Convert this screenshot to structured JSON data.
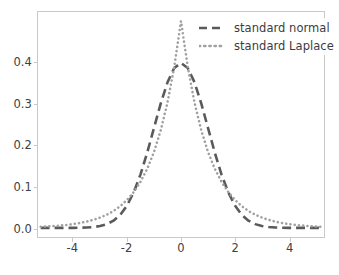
{
  "chart_data": {
    "type": "line",
    "title": "",
    "xlabel": "",
    "ylabel": "",
    "xlim": [
      -5.3,
      5.3
    ],
    "ylim": [
      -0.022,
      0.522
    ],
    "grid": false,
    "legend_position": "upper right",
    "xticks": [
      "-4",
      "-2",
      "0",
      "2",
      "4"
    ],
    "xtick_values": [
      -4,
      -2,
      0,
      2,
      4
    ],
    "yticks": [
      "0.0",
      "0.1",
      "0.2",
      "0.3",
      "0.4"
    ],
    "ytick_values": [
      0.0,
      0.1,
      0.2,
      0.3,
      0.4
    ],
    "series": [
      {
        "name": "standard normal",
        "linestyle": "dashed",
        "color": "#5a5a5a",
        "linewidth": 2.6,
        "peak_value": 0.399,
        "x": [
          -5.2,
          -5.0,
          -4.75,
          -4.5,
          -4.25,
          -4.0,
          -3.75,
          -3.5,
          -3.25,
          -3.0,
          -2.75,
          -2.5,
          -2.25,
          -2.0,
          -1.75,
          -1.5,
          -1.25,
          -1.0,
          -0.75,
          -0.5,
          -0.25,
          0.0,
          0.25,
          0.5,
          0.75,
          1.0,
          1.25,
          1.5,
          1.75,
          2.0,
          2.25,
          2.5,
          2.75,
          3.0,
          3.25,
          3.5,
          3.75,
          4.0,
          4.25,
          4.5,
          4.75,
          5.0,
          5.2
        ],
        "y": [
          0.0,
          0.0,
          0.0,
          0.0,
          0.0001,
          0.0001,
          0.0004,
          0.0009,
          0.002,
          0.0044,
          0.0091,
          0.0175,
          0.0317,
          0.054,
          0.0863,
          0.1295,
          0.1826,
          0.242,
          0.3011,
          0.3521,
          0.3867,
          0.3989,
          0.3867,
          0.3521,
          0.3011,
          0.242,
          0.1826,
          0.1295,
          0.0863,
          0.054,
          0.0317,
          0.0175,
          0.0091,
          0.0044,
          0.002,
          0.0009,
          0.0004,
          0.0001,
          0.0001,
          0.0,
          0.0,
          0.0,
          0.0
        ]
      },
      {
        "name": "standard Laplace",
        "linestyle": "dotted",
        "color": "#a0a0a0",
        "linewidth": 2.6,
        "peak_value": 0.5,
        "x": [
          -5.2,
          -5.0,
          -4.75,
          -4.5,
          -4.25,
          -4.0,
          -3.75,
          -3.5,
          -3.25,
          -3.0,
          -2.75,
          -2.5,
          -2.25,
          -2.0,
          -1.75,
          -1.5,
          -1.25,
          -1.0,
          -0.75,
          -0.5,
          -0.25,
          0.0,
          0.25,
          0.5,
          0.75,
          1.0,
          1.25,
          1.5,
          1.75,
          2.0,
          2.25,
          2.5,
          2.75,
          3.0,
          3.25,
          3.5,
          3.75,
          4.0,
          4.25,
          4.5,
          4.75,
          5.0,
          5.2
        ],
        "y": [
          0.0028,
          0.0034,
          0.0043,
          0.0056,
          0.0071,
          0.0092,
          0.0118,
          0.0151,
          0.0194,
          0.0249,
          0.032,
          0.041,
          0.0527,
          0.0677,
          0.0869,
          0.1116,
          0.1433,
          0.1839,
          0.2362,
          0.3033,
          0.3894,
          0.5,
          0.3894,
          0.3033,
          0.2362,
          0.1839,
          0.1433,
          0.1116,
          0.0869,
          0.0677,
          0.0527,
          0.041,
          0.032,
          0.0249,
          0.0194,
          0.0151,
          0.0118,
          0.0092,
          0.0071,
          0.0056,
          0.0043,
          0.0034,
          0.0028
        ]
      }
    ]
  },
  "legend": {
    "entries": [
      {
        "label": "standard normal"
      },
      {
        "label": "standard Laplace"
      }
    ]
  }
}
